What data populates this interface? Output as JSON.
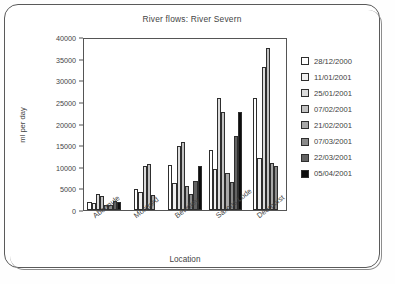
{
  "chart_data": {
    "type": "bar",
    "title": "River flows: River Severn",
    "xlabel": "Location",
    "ylabel": "ml per day",
    "ylim": [
      0,
      40000
    ],
    "yticks": [
      0,
      5000,
      10000,
      15000,
      20000,
      25000,
      30000,
      35000,
      40000
    ],
    "grid": false,
    "legend_position": "right",
    "categories": [
      "Abermule",
      "Montford",
      "Bewdley",
      "Saxons Lode",
      "Deerhurst"
    ],
    "series": [
      {
        "name": "28/12/2000",
        "color": "#ffffff",
        "values": [
          1900,
          5000,
          10500,
          14000,
          26200
        ]
      },
      {
        "name": "11/01/2001",
        "color": "#f0f0f0",
        "values": [
          1600,
          4200,
          6400,
          9600,
          12200
        ]
      },
      {
        "name": "25/01/2001",
        "color": "#dcdcdc",
        "values": [
          3800,
          10200,
          14900,
          26300,
          33500
        ]
      },
      {
        "name": "07/02/2001",
        "color": "#c2c2c2",
        "values": [
          3200,
          10700,
          16000,
          22900,
          37900
        ]
      },
      {
        "name": "21/02/2001",
        "color": "#a8a8a8",
        "values": [
          1200,
          3500,
          5700,
          8600,
          10900
        ]
      },
      {
        "name": "07/03/2001",
        "color": "#8a8a8a",
        "values": [
          1100,
          null,
          3800,
          6600,
          10300
        ]
      },
      {
        "name": "22/03/2001",
        "color": "#636363",
        "values": [
          2100,
          null,
          6800,
          17200,
          null
        ]
      },
      {
        "name": "05/04/2001",
        "color": "#0d0d0d",
        "values": [
          1800,
          null,
          10200,
          23000,
          null
        ]
      }
    ]
  }
}
